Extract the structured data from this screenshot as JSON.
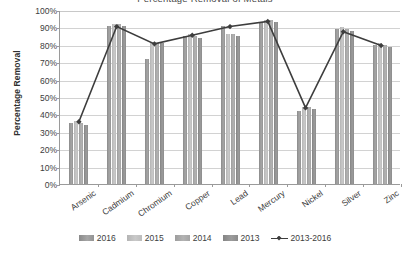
{
  "chart_data": {
    "type": "bar",
    "title": "Percentage Removal of Metals",
    "xlabel": "",
    "ylabel": "Percentage Removal",
    "categories": [
      "Arsenic",
      "Cadmium",
      "Chromium",
      "Copper",
      "Lead",
      "Mercury",
      "Nickel",
      "Silver",
      "Zinc"
    ],
    "ylim": [
      0,
      100
    ],
    "ytick_labels": [
      "100%",
      "90%",
      "80%",
      "70%",
      "60%",
      "50%",
      "40%",
      "30%",
      "20%",
      "10%",
      "0%"
    ],
    "ytick_values": [
      100,
      90,
      80,
      70,
      60,
      50,
      40,
      30,
      20,
      10,
      0
    ],
    "grid": true,
    "legend_position": "bottom",
    "series": [
      {
        "name": "2016",
        "type": "bar",
        "values": [
          35,
          91,
          72,
          85,
          91,
          93,
          42,
          89,
          80
        ]
      },
      {
        "name": "2015",
        "type": "bar",
        "values": [
          36,
          92,
          81,
          86,
          86,
          94,
          44,
          90,
          81
        ]
      },
      {
        "name": "2014",
        "type": "bar",
        "values": [
          35,
          92,
          81,
          85,
          86,
          94,
          44,
          89,
          80
        ]
      },
      {
        "name": "2013",
        "type": "bar",
        "values": [
          34,
          91,
          81,
          84,
          85,
          93,
          43,
          88,
          79
        ]
      },
      {
        "name": "2013-2016",
        "type": "line",
        "values": [
          36,
          91,
          81,
          86,
          91,
          94,
          44,
          88,
          80
        ]
      }
    ]
  },
  "legend": {
    "items": [
      {
        "label": "2016",
        "marker": "bar-swatch"
      },
      {
        "label": "2015",
        "marker": "bar-swatch"
      },
      {
        "label": "2014",
        "marker": "bar-swatch"
      },
      {
        "label": "2013",
        "marker": "bar-swatch"
      },
      {
        "label": "2013-2016",
        "marker": "line-marker"
      }
    ]
  },
  "colors": {
    "series_2016": "#939393",
    "series_2015": "#bcbcbc",
    "series_2014": "#a4a4a4",
    "series_2013": "#8b8b8b",
    "line_2013_2016": "#3d3d3d",
    "gridline": "#d2d2d2",
    "axis": "#9a9a9a",
    "text": "#3d3d3d",
    "background": "#ffffff"
  }
}
